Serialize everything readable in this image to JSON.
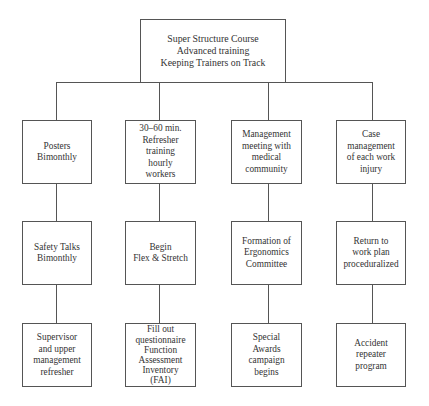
{
  "diagram": {
    "root": {
      "label": "Super Structure Course\nAdvanced training\nKeeping Trainers on Track"
    },
    "columns": [
      {
        "boxes": [
          {
            "label": "Posters\nBimonthly"
          },
          {
            "label": "Safety Talks\nBimonthly"
          },
          {
            "label": "Supervisor\nand upper\nmanagement\nrefresher"
          }
        ]
      },
      {
        "boxes": [
          {
            "label": "30–60 min.\nRefresher\ntraining\nhourly\nworkers"
          },
          {
            "label": "Begin\nFlex & Stretch"
          },
          {
            "label": "Fill out\nquestionnaire\nFunction\nAssessment\nInventory\n(FAI)"
          }
        ]
      },
      {
        "boxes": [
          {
            "label": "Management\nmeeting with\nmedical\ncommunity"
          },
          {
            "label": "Formation of\nErgonomics\nCommittee"
          },
          {
            "label": "Special\nAwards\ncampaign\nbegins"
          }
        ]
      },
      {
        "boxes": [
          {
            "label": "Case\nmanagement\nof each work\ninjury"
          },
          {
            "label": "Return to\nwork plan\nproceduralized"
          },
          {
            "label": "Accident\nrepeater\nprogram"
          }
        ]
      }
    ],
    "colors": {
      "line": "#555555",
      "text": "#333333",
      "background": "#ffffff"
    }
  }
}
